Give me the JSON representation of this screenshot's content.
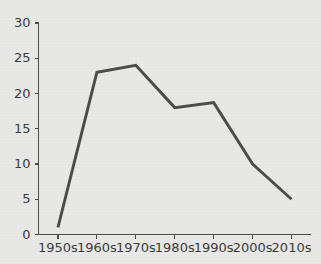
{
  "chart_data": {
    "type": "line",
    "title": "",
    "subtitle": "",
    "xlabel": "",
    "ylabel": "",
    "categories": [
      "1950s",
      "1960s",
      "1970s",
      "1980s",
      "1990s",
      "2000s",
      "2010s"
    ],
    "values": [
      1,
      23,
      24,
      18,
      18.7,
      10,
      5
    ],
    "series": [
      {
        "name": "",
        "values": [
          1,
          23,
          24,
          18,
          18.7,
          10,
          5
        ]
      }
    ],
    "ylim": [
      0,
      30
    ],
    "yticks": [
      0,
      5,
      10,
      15,
      20,
      25,
      30
    ],
    "ytick_labels": [
      "0",
      "5",
      "10",
      "15",
      "20",
      "25",
      "30"
    ],
    "xtick_labels": [
      "1950s",
      "1960s",
      "1970s",
      "1980s",
      "1990s",
      "2000s",
      "2010s"
    ],
    "grid": false,
    "legend": false,
    "legend_position": "none",
    "annotations": [],
    "colors": {
      "line": "#4c4c4c",
      "axis": "#4a4a4a",
      "text": "#3c3c3c",
      "background": "#e9e9e7"
    }
  }
}
